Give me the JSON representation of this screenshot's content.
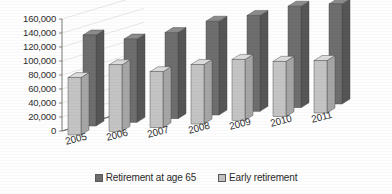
{
  "chart_data": {
    "type": "bar",
    "title": "",
    "subtitle": "",
    "xlabel": "",
    "ylabel": "",
    "categories": [
      "2005",
      "2006",
      "2007",
      "2008",
      "2009",
      "2010",
      "2011"
    ],
    "series": [
      {
        "name": "Retirement at age 65",
        "color": "#6e6e6e",
        "values": [
          130000,
          119000,
          123000,
          134000,
          137000,
          145000,
          143000
        ]
      },
      {
        "name": "Early retirement",
        "color": "#c2c2c2",
        "values": [
          82000,
          95000,
          80000,
          85000,
          87000,
          79000,
          75000
        ]
      }
    ],
    "ylim": [
      0,
      160000
    ],
    "ytick_step": 20000,
    "ytick_labels": [
      "0",
      "20,000",
      "40,000",
      "60,000",
      "80,000",
      "100,000",
      "120,000",
      "140,000",
      "160,000"
    ],
    "grid": true,
    "grid_axis": "y",
    "legend_position": "bottom",
    "projection": "3d-clustered-column",
    "series_draw_order": [
      "Early retirement",
      "Retirement at age 65"
    ]
  },
  "legend": {
    "items": [
      {
        "label": "Retirement at age 65",
        "marker": "dark-square",
        "color": "#6e6e6e"
      },
      {
        "label": "Early retirement",
        "marker": "light-square",
        "color": "#c2c2c2"
      }
    ]
  },
  "colors": {
    "dark_front": "#6e6e6e",
    "dark_top": "#8c8c8c",
    "dark_side": "#565656",
    "light_front": "#c4c4c4",
    "light_top": "#dcdcdc",
    "light_side": "#a6a6a6",
    "axis": "#6b6b6b",
    "grid": "#d8d8d8",
    "text": "#2e2e2e",
    "background": "#fefefe"
  }
}
